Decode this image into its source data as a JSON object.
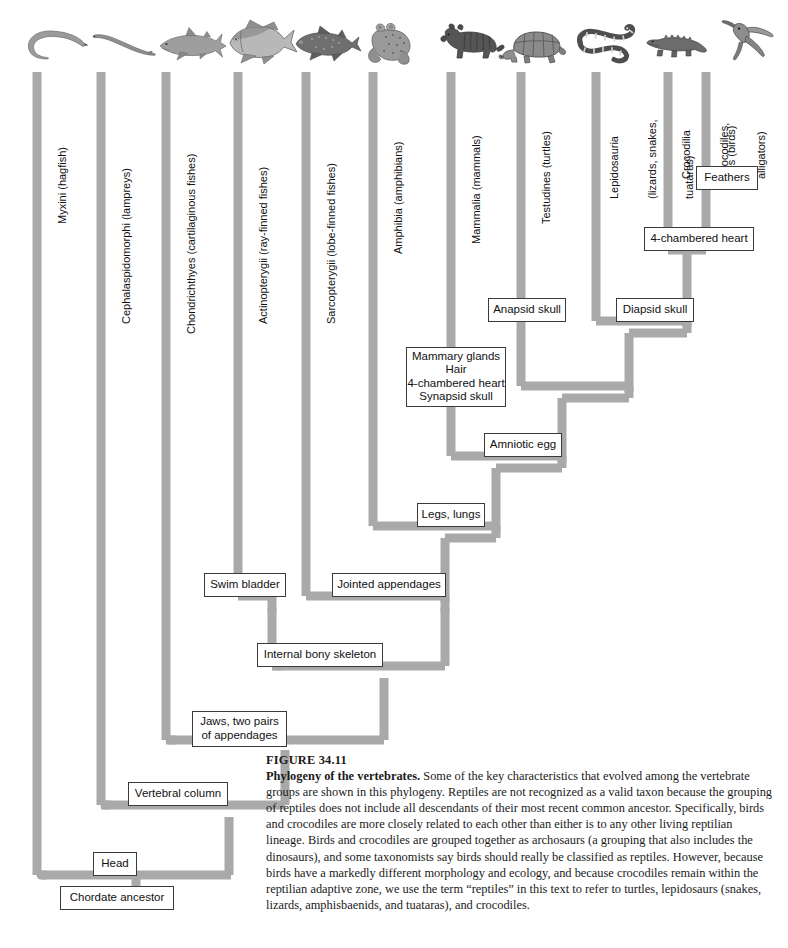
{
  "figure": {
    "number": "FIGURE 34.11",
    "title": "Phylogeny of the vertebrates.",
    "body": "Some of the key characteristics that evolved among the vertebrate groups are shown in this phylogeny. Reptiles are not recognized as a valid taxon because the grouping of reptiles does not include all descendants of their most recent common ancestor. Specifically, birds and crocodiles are more closely related to each other than either is to any other living reptilian lineage. Birds and crocodiles are grouped together as archosaurs (a grouping that also includes the dinosaurs), and some taxonomists say birds should really be classified as reptiles. However, because birds have a markedly different morphology and ecology, and because crocodiles remain within the reptilian adaptive zone, we use the term “reptiles” in this text to refer to turtles, lepidosaurs (snakes, lizards, amphisbaenids, and tuataras), and crocodiles."
  },
  "colors": {
    "branch": "#a9a9a9",
    "branch_edge": "#9a9a9a",
    "box_border": "#3a3a3a",
    "box_fill": "#ffffff",
    "text": "#111111"
  },
  "taxa": [
    {
      "id": "myxini",
      "lines": [
        "Myxini (hagfish)"
      ],
      "icon": "hagfish-illustration",
      "x": 37,
      "label_top": 72
    },
    {
      "id": "cephalaspidomorphi",
      "lines": [
        "Cephalaspidomorphi (lampreys)"
      ],
      "icon": "lamprey-illustration",
      "x": 101,
      "label_top": 72
    },
    {
      "id": "chondrichthyes",
      "lines": [
        "Chondrichthyes (cartilaginous fishes)"
      ],
      "icon": "shark-illustration",
      "x": 166,
      "label_top": 72
    },
    {
      "id": "actinopterygii",
      "lines": [
        "Actinopterygii (ray-finned fishes)"
      ],
      "icon": "tuna-illustration",
      "x": 238,
      "label_top": 72
    },
    {
      "id": "sarcopterygii",
      "lines": [
        "Sarcopterygii (lobe-finned fishes)"
      ],
      "icon": "coelacanth-illustration",
      "x": 306,
      "label_top": 72
    },
    {
      "id": "amphibia",
      "lines": [
        "Amphibia (amphibians)"
      ],
      "icon": "frog-illustration",
      "x": 373,
      "label_top": 72
    },
    {
      "id": "mammalia",
      "lines": [
        "Mammalia (mammals)"
      ],
      "icon": "mammal-illustration",
      "x": 451,
      "label_top": 72
    },
    {
      "id": "testudines",
      "lines": [
        "Testudines (turtles)"
      ],
      "icon": "turtle-illustration",
      "x": 521,
      "label_top": 72
    },
    {
      "id": "lepidosauria",
      "lines": [
        "Lepidosauria",
        "(lizards, snakes,",
        "tuataras)"
      ],
      "icon": "snake-illustration",
      "x": 596,
      "label_top": 72
    },
    {
      "id": "crocodilia",
      "lines": [
        "Crocodilia",
        "(crocodiles,",
        "alligators)"
      ],
      "icon": "crocodile-illustration",
      "x": 668,
      "label_top": 72
    },
    {
      "id": "aves",
      "lines": [
        "Aves (birds)"
      ],
      "icon": "hummingbird-illustration",
      "x": 706,
      "label_top": 72
    }
  ],
  "characters": [
    {
      "id": "feathers",
      "lines": [
        "Feathers"
      ],
      "x": 724,
      "y": 178,
      "w": 62,
      "h": 24
    },
    {
      "id": "four-chambered-heart",
      "lines": [
        "4-chambered heart"
      ],
      "x": 699,
      "y": 238,
      "w": 108,
      "h": 24
    },
    {
      "id": "anapsid-skull",
      "lines": [
        "Anapsid skull"
      ],
      "x": 526,
      "y": 309,
      "w": 80,
      "h": 24
    },
    {
      "id": "diapsid-skull",
      "lines": [
        "Diapsid skull"
      ],
      "x": 655,
      "y": 309,
      "w": 78,
      "h": 24
    },
    {
      "id": "mammal-characters",
      "lines": [
        "Mammary glands",
        "Hair",
        "4-chambered heart",
        "Synapsid skull"
      ],
      "x": 459,
      "y": 375,
      "w": 104,
      "h": 62
    },
    {
      "id": "amniotic-egg",
      "lines": [
        "Amniotic egg"
      ],
      "x": 522,
      "y": 444,
      "w": 80,
      "h": 24
    },
    {
      "id": "legs-lungs",
      "lines": [
        "Legs, lungs"
      ],
      "x": 452,
      "y": 514,
      "w": 70,
      "h": 24
    },
    {
      "id": "swim-bladder",
      "lines": [
        "Swim bladder"
      ],
      "x": 245,
      "y": 584,
      "w": 82,
      "h": 24
    },
    {
      "id": "jointed-appendages",
      "lines": [
        "Jointed appendages"
      ],
      "x": 388,
      "y": 584,
      "w": 114,
      "h": 24
    },
    {
      "id": "internal-bony-skeleton",
      "lines": [
        "Internal bony skeleton"
      ],
      "x": 320,
      "y": 654,
      "w": 128,
      "h": 24
    },
    {
      "id": "jaws-two-pairs",
      "lines": [
        "Jaws, two pairs",
        "of appendages"
      ],
      "x": 238,
      "y": 722,
      "w": 94,
      "h": 36
    },
    {
      "id": "vertebral-column",
      "lines": [
        "Vertebral column"
      ],
      "x": 178,
      "y": 793,
      "w": 102,
      "h": 24
    },
    {
      "id": "head",
      "lines": [
        "Head"
      ],
      "x": 114,
      "y": 863,
      "w": 44,
      "h": 24
    },
    {
      "id": "chordate-ancestor",
      "lines": [
        "Chordate ancestor"
      ],
      "x": 114,
      "y": 897,
      "w": 110,
      "h": 24
    }
  ],
  "nodes": [
    {
      "id": "chordate-root",
      "label": "Chordate ancestor",
      "y": 897
    },
    {
      "id": "head-node",
      "label": "Head",
      "y": 875
    },
    {
      "id": "vertebrate-node",
      "label": "Vertebral column",
      "y": 805
    },
    {
      "id": "gnathostome-node",
      "label": "Jaws, two pairs of appendages",
      "y": 740
    },
    {
      "id": "osteichthyes-node",
      "label": "Internal bony skeleton",
      "y": 666
    },
    {
      "id": "tetrapod-node",
      "label": "Legs, lungs",
      "y": 526
    },
    {
      "id": "amniote-node",
      "label": "Amniotic egg",
      "y": 456
    },
    {
      "id": "reptile-node",
      "label": "Reptile clade",
      "y": 386
    },
    {
      "id": "diapsid-node",
      "label": "Diapsid skull",
      "y": 321
    },
    {
      "id": "archosaur-node",
      "label": "4-chambered heart",
      "y": 250
    }
  ]
}
